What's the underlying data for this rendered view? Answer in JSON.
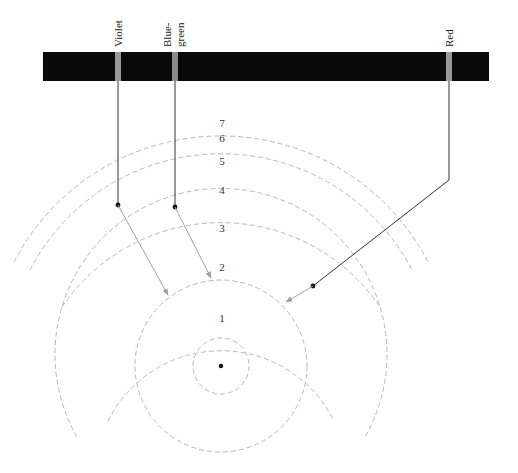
{
  "spectrum": {
    "bar_color": "#0a0a0a",
    "line_color": "#9a9a9a",
    "lines": [
      {
        "id": "violet",
        "label_lines": [
          "Violet"
        ],
        "x": 118
      },
      {
        "id": "blue-green",
        "label_lines": [
          "Blue-",
          "green"
        ],
        "x": 175
      },
      {
        "id": "red",
        "label_lines": [
          "Red"
        ],
        "x": 449
      }
    ]
  },
  "orbits": {
    "center": [
      221,
      366
    ],
    "levels": [
      {
        "n": "1",
        "r": 28,
        "label_y": 321,
        "full": true
      },
      {
        "n": "2",
        "r": 86,
        "label_y": 271,
        "full": true
      },
      {
        "n": "3",
        "r": 126,
        "label_y": 232
      },
      {
        "n": "4",
        "r": 166,
        "label_y": 194
      },
      {
        "n": "5",
        "r": 192,
        "label_y": 165
      },
      {
        "n": "6",
        "r": 215,
        "label_y": 142
      },
      {
        "n": "7",
        "r": 233,
        "label_y": 126
      }
    ]
  },
  "transitions": [
    {
      "line": "violet",
      "from_level": "6",
      "to_level": "2"
    },
    {
      "line": "blue-green",
      "from_level": "4",
      "to_level": "2"
    },
    {
      "line": "red",
      "from_level": "3",
      "to_level": "2"
    }
  ]
}
